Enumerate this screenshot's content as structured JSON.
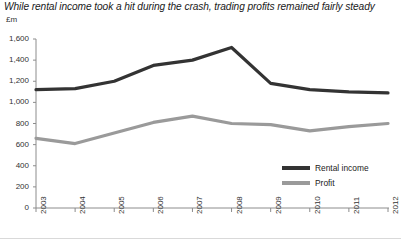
{
  "chart_data": {
    "type": "line",
    "title": "While rental income took a hit during the crash, trading profits remained fairly steady",
    "xlabel": "",
    "ylabel": "£m",
    "ylim": [
      0,
      1600
    ],
    "ytick_values": [
      0,
      200,
      400,
      600,
      800,
      1000,
      1200,
      1400,
      1600
    ],
    "ytick_labels": [
      "0",
      "200",
      "400",
      "600",
      "800",
      "1,000",
      "1,200",
      "1,400",
      "1,600"
    ],
    "categories": [
      "2003",
      "2004",
      "2005",
      "2006",
      "2007",
      "2008",
      "2009",
      "2010",
      "2011",
      "2012"
    ],
    "grid": false,
    "legend_position": "inside-right",
    "series": [
      {
        "name": "Rental income",
        "color": "#333333",
        "values": [
          1120,
          1130,
          1200,
          1350,
          1400,
          1520,
          1180,
          1120,
          1100,
          1090
        ]
      },
      {
        "name": "Profit",
        "color": "#9a9a9a",
        "values": [
          660,
          610,
          710,
          810,
          870,
          800,
          790,
          730,
          770,
          800
        ]
      }
    ]
  },
  "axis": {
    "unit_label": "£m"
  },
  "legend": {
    "items": [
      {
        "label": "Rental income",
        "color": "#333333"
      },
      {
        "label": "Profit",
        "color": "#9a9a9a"
      }
    ]
  },
  "geometry": {
    "plot_left": 36,
    "plot_right": 388,
    "plot_top": 39,
    "plot_bottom": 208
  }
}
